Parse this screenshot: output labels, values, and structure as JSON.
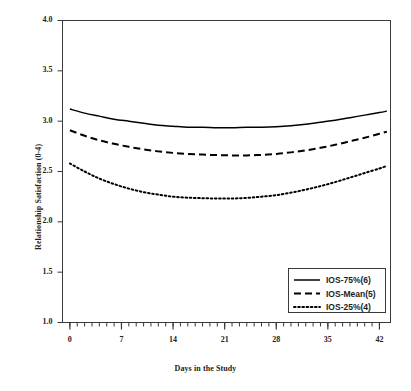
{
  "chart_data": {
    "type": "line",
    "title": "",
    "xlabel": "Days in the Study",
    "ylabel": "Relationship Satisfaction (0-4)",
    "xlim": [
      -1,
      43.5
    ],
    "ylim": [
      1.0,
      4.0
    ],
    "grid": false,
    "legend_position": "lower right",
    "x_major_ticks": [
      0,
      7,
      14,
      21,
      28,
      35,
      42
    ],
    "x_tick_labels": [
      "0",
      "7",
      "14",
      "21",
      "28",
      "35",
      "42"
    ],
    "x_minor_tick_step": 1,
    "y_ticks": [
      1.0,
      1.5,
      2.0,
      2.5,
      3.0,
      3.5,
      4.0
    ],
    "y_tick_labels": [
      "1.0",
      "1.5",
      "2.0",
      "2.5",
      "3.0",
      "3.5",
      "4.0"
    ],
    "x": [
      0,
      2,
      4,
      6,
      8,
      10,
      12,
      14,
      16,
      18,
      20,
      22,
      24,
      26,
      28,
      30,
      32,
      34,
      36,
      38,
      40,
      42,
      43
    ],
    "series": [
      {
        "name": "IOS-75%(6)",
        "style": "solid",
        "color": "#000000",
        "values": [
          3.12,
          3.08,
          3.05,
          3.02,
          3.0,
          2.98,
          2.96,
          2.95,
          2.94,
          2.94,
          2.935,
          2.935,
          2.94,
          2.94,
          2.945,
          2.955,
          2.97,
          2.99,
          3.01,
          3.035,
          3.06,
          3.085,
          3.1
        ]
      },
      {
        "name": "IOS-Mean(5)",
        "style": "dashed",
        "color": "#000000",
        "values": [
          2.91,
          2.855,
          2.81,
          2.775,
          2.745,
          2.72,
          2.7,
          2.685,
          2.675,
          2.668,
          2.663,
          2.66,
          2.66,
          2.665,
          2.675,
          2.69,
          2.71,
          2.735,
          2.765,
          2.8,
          2.835,
          2.875,
          2.895
        ]
      },
      {
        "name": "IOS-25%(4)",
        "style": "dotted",
        "color": "#000000",
        "values": [
          2.58,
          2.5,
          2.43,
          2.375,
          2.33,
          2.295,
          2.27,
          2.25,
          2.24,
          2.235,
          2.232,
          2.232,
          2.238,
          2.25,
          2.265,
          2.29,
          2.32,
          2.355,
          2.395,
          2.44,
          2.485,
          2.53,
          2.555
        ]
      }
    ]
  },
  "legend": {
    "items": [
      {
        "label": "IOS-75%(6)",
        "style": "solid"
      },
      {
        "label": "IOS-Mean(5)",
        "style": "dashed"
      },
      {
        "label": "IOS-25%(4)",
        "style": "dotted"
      }
    ]
  },
  "axes": {
    "x_title": "Days in the Study",
    "y_title": "Relationship Satisfaction (0-4)"
  }
}
